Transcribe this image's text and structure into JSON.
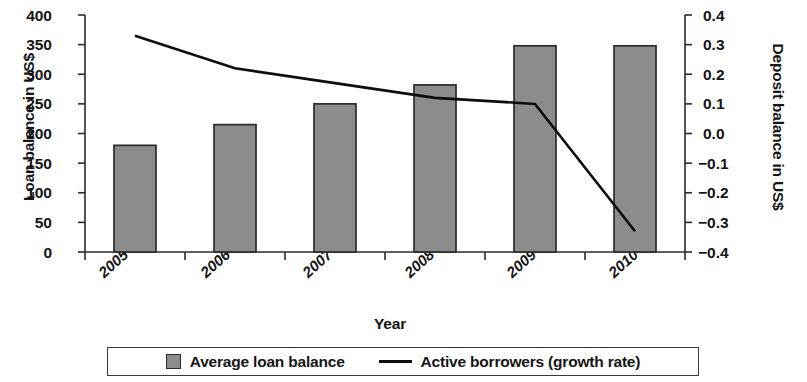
{
  "chart_data": {
    "type": "bar",
    "title": "",
    "xlabel": "Year",
    "categories": [
      "2005",
      "2006",
      "2007",
      "2008",
      "2009",
      "2010"
    ],
    "grid": false,
    "legend_position": "bottom",
    "axes": {
      "left": {
        "label": "Loan balance in US$",
        "ylim": [
          0,
          400
        ],
        "tick_step": 50,
        "ticks": [
          "400",
          "350",
          "300",
          "250",
          "200",
          "150",
          "100",
          "50",
          "0"
        ],
        "tick_values": [
          400,
          350,
          300,
          250,
          200,
          150,
          100,
          50,
          0
        ]
      },
      "right": {
        "label": "Deposit balance in US$",
        "ylim": [
          -0.4,
          0.4
        ],
        "tick_step": 0.1,
        "ticks": [
          "0.4",
          "0.3",
          "0.2",
          "0.1",
          "0.0",
          "−0.1",
          "−0.2",
          "−0.3",
          "−0.4"
        ],
        "tick_values": [
          0.4,
          0.3,
          0.2,
          0.1,
          0.0,
          -0.1,
          -0.2,
          -0.3,
          -0.4
        ]
      }
    },
    "series": [
      {
        "name": "Average loan balance",
        "type": "bar",
        "axis": "left",
        "color": "#8c8c8c",
        "edge_color": "#2b2b2b",
        "values": [
          180,
          215,
          250,
          282,
          348,
          348
        ]
      },
      {
        "name": "Active borrowers (growth rate)",
        "type": "line",
        "axis": "right",
        "color": "#0d0d0d",
        "values": [
          0.33,
          0.22,
          0.17,
          0.12,
          0.1,
          -0.33
        ]
      }
    ]
  },
  "legend": {
    "items": [
      {
        "label": "Average loan balance",
        "marker": "square-swatch"
      },
      {
        "label": "Active borrowers (growth rate)",
        "marker": "line-stroke"
      }
    ]
  }
}
